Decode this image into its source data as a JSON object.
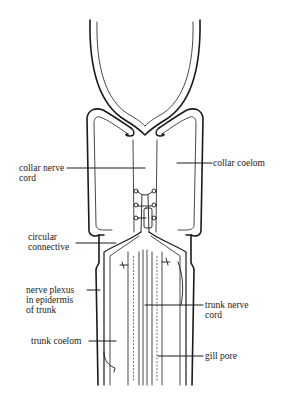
{
  "figure": {
    "colors": {
      "ink": "#1a1a1a",
      "background": "#ffffff"
    }
  },
  "labels": {
    "collar_nerve_cord": "collar nerve\ncord",
    "collar_coelom": "collar coelom",
    "circular_connective": "circular\nconnective",
    "nerve_plexus": "nerve plexus\nin epidermis\nof trunk",
    "trunk_nerve_cord": "trunk nerve\ncord",
    "trunk_coelom": "trunk coelom",
    "gill_pore": "gill pore"
  }
}
